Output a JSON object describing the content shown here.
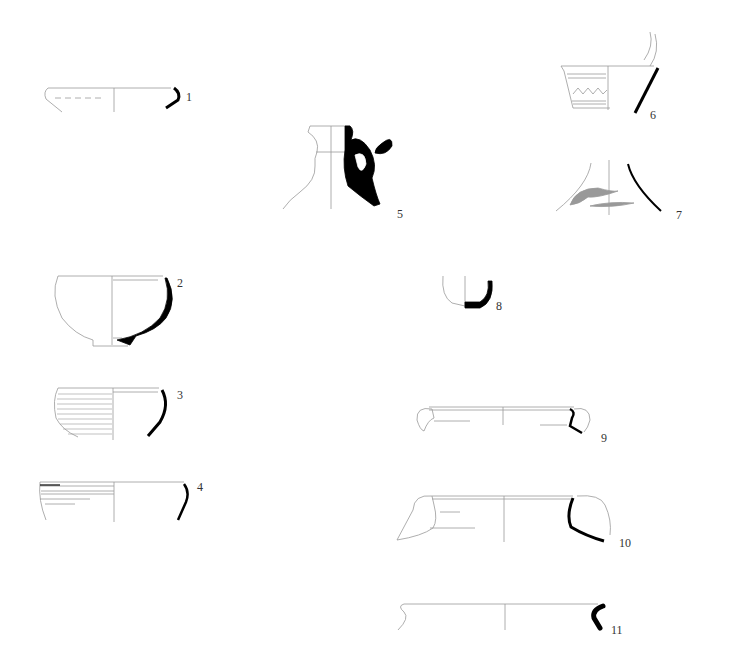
{
  "plate": {
    "type": "archaeological pottery profile drawings",
    "background": "#ffffff",
    "section_color": "#000000",
    "outline_color": "#999999",
    "slip_color": "#999999"
  },
  "figures": [
    {
      "id": 1,
      "label": "1",
      "form": "shallow bowl rim",
      "label_pos": [
        186,
        91
      ]
    },
    {
      "id": 2,
      "label": "2",
      "form": "hemispherical bowl with ring foot",
      "label_pos": [
        177,
        277
      ]
    },
    {
      "id": 3,
      "label": "3",
      "form": "ribbed bowl",
      "label_pos": [
        177,
        389
      ]
    },
    {
      "id": 4,
      "label": "4",
      "form": "carinated bowl rim",
      "label_pos": [
        197,
        481
      ]
    },
    {
      "id": 5,
      "label": "5",
      "form": "jug neck with handle",
      "label_pos": [
        397,
        208
      ]
    },
    {
      "id": 6,
      "label": "6",
      "form": "conical bowl with zigzag decoration",
      "label_pos": [
        650,
        109
      ]
    },
    {
      "id": 7,
      "label": "7",
      "form": "flask neck with painted bands",
      "label_pos": [
        676,
        209
      ]
    },
    {
      "id": 8,
      "label": "8",
      "form": "small cup base",
      "label_pos": [
        496,
        300
      ]
    },
    {
      "id": 9,
      "label": "9",
      "form": "bowl with horizontal handles",
      "label_pos": [
        601,
        432
      ]
    },
    {
      "id": 10,
      "label": "10",
      "form": "basin with horizontal handles",
      "label_pos": [
        619,
        537
      ]
    },
    {
      "id": 11,
      "label": "11",
      "form": "jar rim",
      "label_pos": [
        611,
        624
      ]
    }
  ]
}
